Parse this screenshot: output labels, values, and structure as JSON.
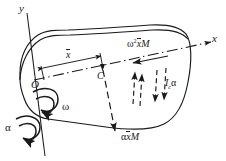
{
  "figure": {
    "kind": "engineering-mechanics-free-body-diagram",
    "stroke_color": "#1a1a1a",
    "background": "#ffffff"
  },
  "axes": {
    "y_label": "y",
    "x_label": "x",
    "origin_label": "O"
  },
  "points": {
    "center_of_mass_label": "C"
  },
  "dimensions": {
    "xbar_label": "x",
    "xbar_overbar": true
  },
  "rotation": {
    "omega_label": "ω",
    "alpha_label": "α"
  },
  "forces": [
    {
      "name": "centripetal-inertia-force",
      "latex": "ω²x̄M",
      "parts": {
        "omega": "ω",
        "exponent": "2",
        "xbar": "x",
        "mass": "M"
      }
    },
    {
      "name": "moment-of-inertia-couple",
      "latex": "I_cα",
      "parts": {
        "symbol": "I",
        "subscript": "c",
        "alpha": "α"
      }
    },
    {
      "name": "tangential-inertia-force",
      "latex": "αx̄M",
      "parts": {
        "alpha": "α",
        "xbar": "x",
        "mass": "M"
      }
    }
  ]
}
